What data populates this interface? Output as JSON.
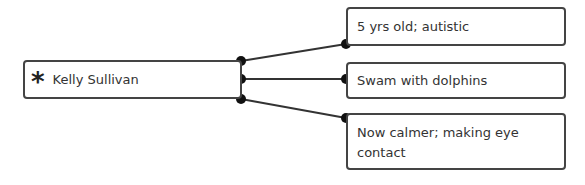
{
  "diagram": {
    "root": {
      "icon": "asterisk-icon",
      "label": "Kelly Sullivan"
    },
    "children": [
      {
        "label": "5 yrs old; autistic"
      },
      {
        "label": "Swam with dolphins"
      },
      {
        "label": "Now calmer; making eye contact"
      }
    ],
    "colors": {
      "border": "#444444",
      "text": "#333333",
      "background": "#ffffff"
    }
  }
}
